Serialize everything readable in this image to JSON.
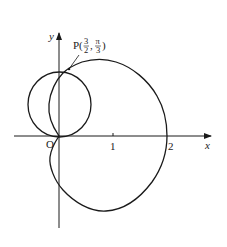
{
  "diagram": {
    "type": "polar-curves",
    "axes": {
      "x_label": "x",
      "y_label": "y",
      "origin_label": "O",
      "x_ticks": [
        "1",
        "2"
      ]
    },
    "point": {
      "name": "P",
      "label_prefix": "P(",
      "r_num": "3",
      "r_den": "2",
      "sep": ",",
      "theta_num": "π",
      "theta_den": "3",
      "label_suffix": ")"
    },
    "curves": [
      {
        "name": "circle",
        "description": "circle tangent to x-axis at origin"
      },
      {
        "name": "cardioid",
        "description": "cardioid through origin, x-intercept 2"
      }
    ],
    "colors": {
      "stroke": "#1a1a1a",
      "background": "#ffffff"
    }
  }
}
